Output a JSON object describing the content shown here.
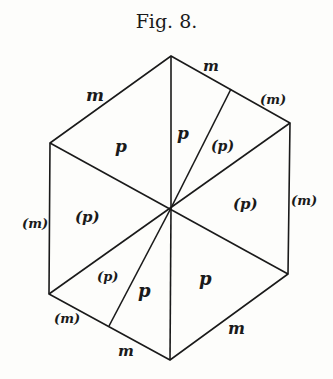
{
  "figure": {
    "title": "Fig. 8.",
    "edge_labels": {
      "top_left": "m",
      "top_right_upper": "m",
      "top_right_lower": "(m)",
      "right": "(m)",
      "bottom_right": "m",
      "bottom_left_lower": "m",
      "bottom_left_upper": "(m)",
      "left": "(m)"
    },
    "face_labels": {
      "upper_left": "p",
      "top_center": "p",
      "top_right_sliver": "(p)",
      "right": "(p)",
      "left": "(p)",
      "bottom_left_sliver": "(p)",
      "bottom_center": "p",
      "bottom_right": "p"
    }
  }
}
